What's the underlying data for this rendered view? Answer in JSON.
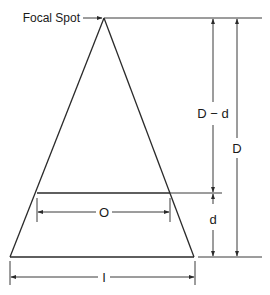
{
  "diagram": {
    "labels": {
      "focal_spot": "Focal Spot",
      "d_minus_d": "D − d",
      "D": "D",
      "d": "d",
      "O": "O",
      "I": "I"
    },
    "colors": {
      "line": "#2a2a2a",
      "background": "#ffffff"
    },
    "geometry": {
      "apex": [
        104,
        18
      ],
      "object_plane_y": 193,
      "image_plane_y": 257,
      "object_width_span": [
        37,
        170
      ],
      "image_width_span": [
        10,
        194
      ]
    }
  }
}
